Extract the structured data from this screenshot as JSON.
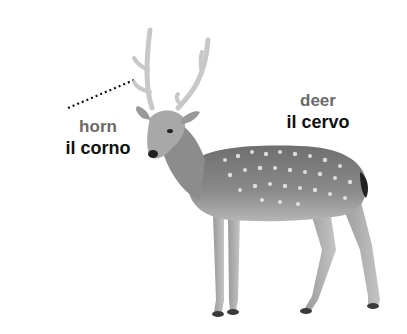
{
  "labels": {
    "horn": {
      "english": "horn",
      "italian": "il corno"
    },
    "deer": {
      "english": "deer",
      "italian": "il cervo"
    }
  },
  "image": {
    "subject": "spotted deer (stag) with antlers",
    "icon": "deer-illustration"
  },
  "colors": {
    "english_text": "#6a6a6a",
    "italian_text": "#111111",
    "background": "#ffffff"
  }
}
